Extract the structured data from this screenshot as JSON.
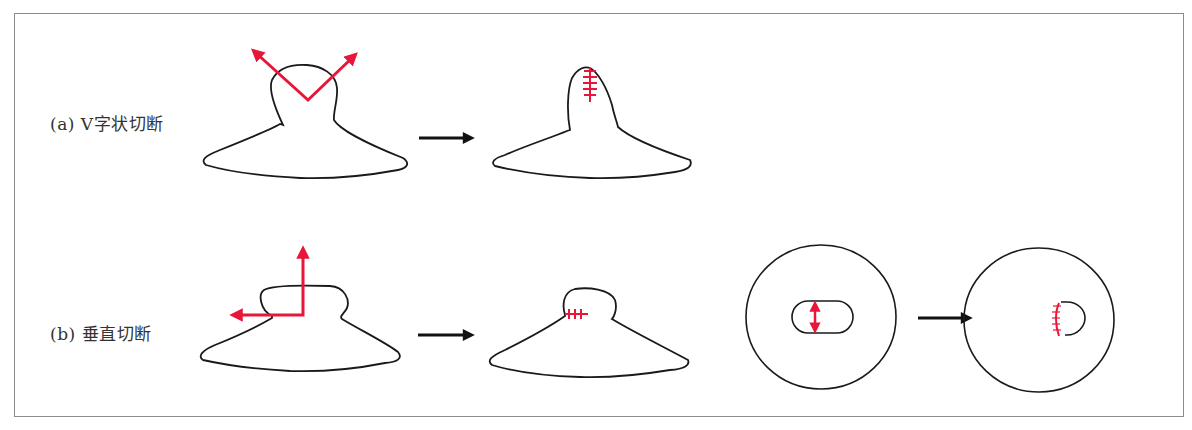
{
  "figure": {
    "rows": [
      {
        "id": "a",
        "label": "(a) V字状切断",
        "steps": [
          "before: V-shaped cut arrows",
          "after: vertical suture line"
        ]
      },
      {
        "id": "b",
        "label": "(b) 垂直切断",
        "steps": [
          "before: perpendicular cut arrows",
          "after: horizontal suture at neck",
          "top view before: oval opening with vertical double arrow",
          "top view after: D-shaped opening with curved suture"
        ]
      }
    ],
    "colors": {
      "outline": "#1a1a1a",
      "cut": "#e8173a",
      "arrow": "#111111",
      "frame": "#8c8c8c"
    },
    "icons": [
      "transition-arrow-icon",
      "cut-direction-arrow-icon",
      "suture-mark-icon"
    ]
  }
}
